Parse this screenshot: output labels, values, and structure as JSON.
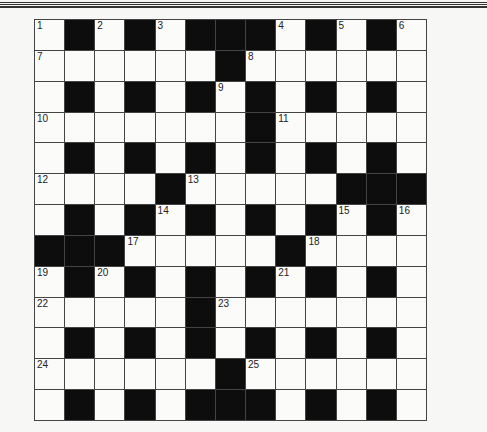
{
  "puzzle": {
    "rows": 13,
    "cols": 13,
    "grid": [
      "W#W#W###W#W#W",
      "WWWWWW#WWWWWW",
      "W#W#W#W#W#W#W",
      "WWWWWWW#WWWWW",
      "W#W#W#W#W#W#W",
      "WWWW#WWWWW###",
      "W#W#W#W#W#W#W",
      "###WWWWW#WWWW",
      "W#W#W#W#W#W#W",
      "WWWWW#WWWWWWW",
      "W#W#W#W#W#W#W",
      "WWWWWW#WWWWWW",
      "W#W#W###W#W#W"
    ],
    "numbers": [
      {
        "r": 0,
        "c": 0,
        "n": "1"
      },
      {
        "r": 0,
        "c": 2,
        "n": "2"
      },
      {
        "r": 0,
        "c": 4,
        "n": "3"
      },
      {
        "r": 0,
        "c": 8,
        "n": "4"
      },
      {
        "r": 0,
        "c": 10,
        "n": "5"
      },
      {
        "r": 0,
        "c": 12,
        "n": "6"
      },
      {
        "r": 1,
        "c": 0,
        "n": "7"
      },
      {
        "r": 1,
        "c": 7,
        "n": "8"
      },
      {
        "r": 2,
        "c": 6,
        "n": "9"
      },
      {
        "r": 3,
        "c": 0,
        "n": "10"
      },
      {
        "r": 3,
        "c": 8,
        "n": "11"
      },
      {
        "r": 5,
        "c": 0,
        "n": "12"
      },
      {
        "r": 5,
        "c": 5,
        "n": "13"
      },
      {
        "r": 6,
        "c": 4,
        "n": "14"
      },
      {
        "r": 6,
        "c": 10,
        "n": "15"
      },
      {
        "r": 6,
        "c": 12,
        "n": "16"
      },
      {
        "r": 7,
        "c": 3,
        "n": "17"
      },
      {
        "r": 7,
        "c": 9,
        "n": "18"
      },
      {
        "r": 8,
        "c": 0,
        "n": "19"
      },
      {
        "r": 8,
        "c": 2,
        "n": "20"
      },
      {
        "r": 8,
        "c": 8,
        "n": "21"
      },
      {
        "r": 9,
        "c": 0,
        "n": "22"
      },
      {
        "r": 9,
        "c": 6,
        "n": "23"
      },
      {
        "r": 11,
        "c": 0,
        "n": "24"
      },
      {
        "r": 11,
        "c": 7,
        "n": "25"
      }
    ],
    "colors": {
      "black_cell": "#0d0d0d",
      "white_cell": "#fbfbf9",
      "grid_line": "#444444"
    }
  }
}
